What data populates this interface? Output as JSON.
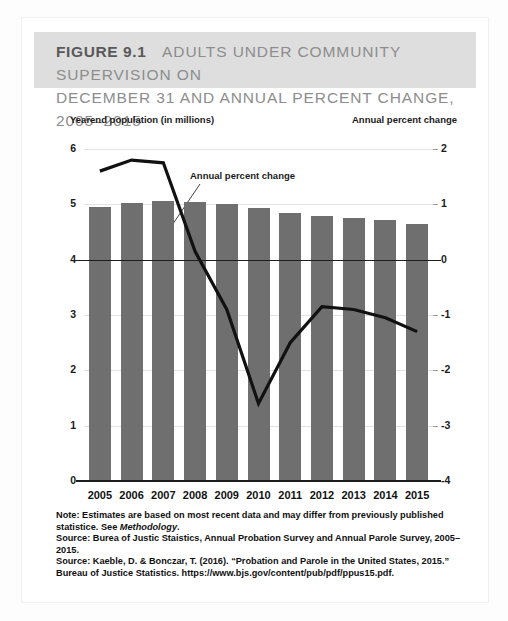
{
  "figure": {
    "label": "FIGURE 9.1",
    "title_line1": "ADULTS UNDER COMMUNITY SUPERVISION ON",
    "title_line2": "DECEMBER 31 AND ANNUAL PERCENT CHANGE, 2005–2015"
  },
  "axis_captions": {
    "left": "Yearend population (in millions)",
    "right": "Annual percent change"
  },
  "annotation": {
    "text": "Annual percent change"
  },
  "notes": {
    "note": "Note: Estimates are based on most recent data and may differ from previously published statistice. See ",
    "note_italic": "Methodology",
    "note_end": ".",
    "source1": "Source: Burea of Justic Staistics, Annual Probation Survey and Annual Parole Survey, 2005–2015.",
    "source2": "Source: Kaeble, D. & Bonczar, T. (2016). “Probation and Parole in the United States, 2015.” Bureau of Justice Statistics. https://www.bjs.gov/content/pub/pdf/ppus15.pdf."
  },
  "colors": {
    "bar": "#6f6f6f",
    "line": "#111111",
    "title_band": "#dedede",
    "title_text": "#8d8d8d",
    "title_strong": "#595959",
    "grid": "#e3e3e3",
    "axis": "#1d1d1d"
  },
  "chart_data": {
    "type": "bar",
    "title": "ADULTS UNDER COMMUNITY SUPERVISION ON DECEMBER 31 AND ANNUAL PERCENT CHANGE, 2005–2015",
    "xlabel": "",
    "categories": [
      "2005",
      "2006",
      "2007",
      "2008",
      "2009",
      "2010",
      "2011",
      "2012",
      "2013",
      "2014",
      "2015"
    ],
    "grid": true,
    "legend": "none",
    "series": [
      {
        "name": "Yearend population (in millions)",
        "type": "bar",
        "axis": "left",
        "ylabel": "Yearend population (in millions)",
        "ylim": [
          0,
          6
        ],
        "yticks": [
          0,
          1,
          2,
          3,
          4,
          5,
          6
        ],
        "values": [
          4.95,
          5.03,
          5.06,
          5.05,
          5.0,
          4.93,
          4.85,
          4.79,
          4.75,
          4.71,
          4.65
        ]
      },
      {
        "name": "Annual percent change",
        "type": "line",
        "axis": "right",
        "ylabel": "Annual percent change",
        "ylim": [
          -4,
          2
        ],
        "yticks": [
          2,
          1,
          0,
          -1,
          -2,
          -3,
          -4
        ],
        "values": [
          1.6,
          1.8,
          1.75,
          0.15,
          -0.9,
          -2.6,
          -1.5,
          -0.85,
          -0.9,
          -1.05,
          -1.3
        ]
      }
    ]
  }
}
